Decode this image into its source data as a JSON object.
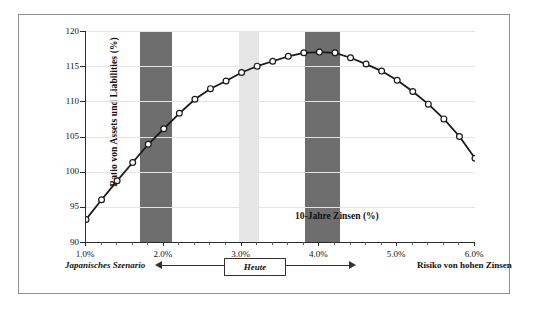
{
  "chart_data": {
    "type": "line",
    "title": "",
    "xlabel": "10-Jahre Zinsen (%)",
    "ylabel": "Ratio von Assets und Liabilities (%)",
    "xlim": [
      1.0,
      6.0
    ],
    "ylim": [
      90,
      120
    ],
    "xticklabels": [
      "1.0%",
      "2.0%",
      "3.0%",
      "4.0%",
      "5.0%",
      "6.0%"
    ],
    "xtickvalues": [
      1.0,
      2.0,
      3.0,
      4.0,
      5.0,
      6.0
    ],
    "yticklabels": [
      "90",
      "95",
      "100",
      "105",
      "110",
      "115",
      "120"
    ],
    "ytickvalues": [
      90,
      95,
      100,
      105,
      110,
      115,
      120
    ],
    "grid": "horizontal",
    "legend": "none",
    "marker": "open-circle",
    "line_color": "#1a1a1a",
    "series": [
      {
        "name": "Ratio von Assets und Liabilities",
        "x": [
          1.0,
          1.2,
          1.4,
          1.6,
          1.8,
          2.0,
          2.2,
          2.4,
          2.6,
          2.8,
          3.0,
          3.2,
          3.4,
          3.6,
          3.8,
          4.0,
          4.2,
          4.4,
          4.6,
          4.8,
          5.0,
          5.2,
          5.4,
          5.6,
          5.8,
          6.0
        ],
        "values": [
          93.2,
          96.0,
          98.7,
          101.3,
          103.9,
          106.1,
          108.3,
          110.3,
          111.8,
          112.9,
          114.1,
          115.0,
          115.7,
          116.4,
          116.9,
          117.0,
          116.9,
          116.2,
          115.3,
          114.3,
          113.0,
          111.4,
          109.6,
          107.5,
          105.0,
          101.9
        ]
      }
    ],
    "bands": [
      {
        "name": "deflation-band",
        "from": 1.7,
        "to": 2.1,
        "color": "#6e6e6e"
      },
      {
        "name": "current-band",
        "from": 2.97,
        "to": 3.22,
        "color": "#e6e6e6"
      },
      {
        "name": "high-rate-band",
        "from": 3.82,
        "to": 4.27,
        "color": "#6e6e6e"
      }
    ]
  },
  "annotations": {
    "left_note": "Japanisches Szenario",
    "center_box": "Heute",
    "right_note": "Risiko von hohen Zinsen"
  }
}
